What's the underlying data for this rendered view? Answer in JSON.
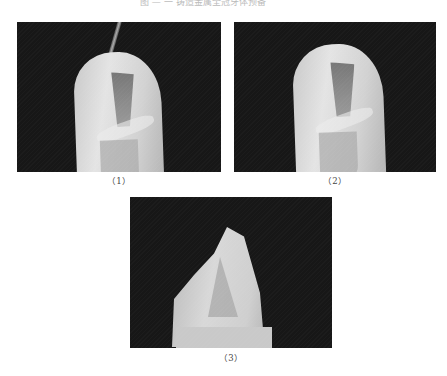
{
  "page": {
    "header_text": "图 — 一  铸造金属全冠牙体预备",
    "background": "#ffffff"
  },
  "figures": [
    {
      "id": "1",
      "caption": "（1）",
      "description": "Tooth preparation with instrument tip inserted at occlusal/incisal groove"
    },
    {
      "id": "2",
      "caption": "（2）",
      "description": "Tooth preparation, same view without instrument"
    },
    {
      "id": "3",
      "caption": "（3）",
      "description": "Tooth preparation viewed from proximal/incisal angle"
    }
  ],
  "colors": {
    "photo_background": "#171717",
    "tooth": "#d6d6d6",
    "caption_text": "#444444"
  }
}
